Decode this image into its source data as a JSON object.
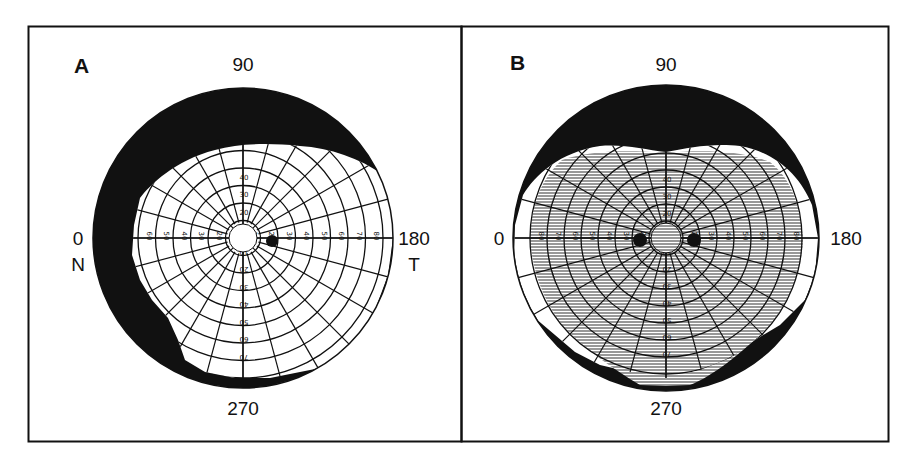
{
  "figure": {
    "panels": [
      {
        "id": "A",
        "label": "A",
        "axis_labels": {
          "top": "90",
          "bottom": "270",
          "left": "0",
          "right": "180",
          "left_sub": "N",
          "right_sub": "T"
        },
        "center": [
          243,
          238
        ],
        "radius": 150,
        "ring_step_px": 17.5,
        "horizontal_ticks_left": [
          "60",
          "50",
          "40",
          "30",
          "20",
          "10"
        ],
        "horizontal_ticks_right": [
          "10",
          "20",
          "30",
          "40",
          "50",
          "60",
          "70",
          "80"
        ],
        "vertical_ticks_up": [
          "10",
          "20",
          "30",
          "40"
        ],
        "vertical_ticks_down": [
          "10",
          "20",
          "30",
          "40",
          "50",
          "60",
          "70"
        ],
        "description": "Visual field with black (lost) region at top and nasal side; blind spot at temporal 15 degrees"
      },
      {
        "id": "B",
        "label": "B",
        "axis_labels": {
          "top": "90",
          "bottom": "270",
          "left": "0",
          "right": "180"
        },
        "center": [
          666,
          238
        ],
        "radius": 153,
        "ring_step_px": 17,
        "horizontal_ticks_left": [
          "80",
          "70",
          "60",
          "50",
          "40",
          "30",
          "20"
        ],
        "horizontal_ticks_right": [
          "20",
          "30",
          "40",
          "50",
          "60",
          "70",
          "80"
        ],
        "vertical_ticks_up": [
          "10",
          "20",
          "30",
          "40"
        ],
        "vertical_ticks_down": [
          "10",
          "20",
          "30",
          "40",
          "50",
          "60",
          "70"
        ],
        "description": "Binocular visual field with hatched overlap region, black loss areas at top and bottom; two blind spots"
      }
    ],
    "colors": {
      "ink": "#111111",
      "paper": "#ffffff",
      "hatch": "#555555"
    }
  }
}
